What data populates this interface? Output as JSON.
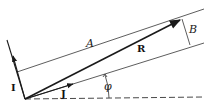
{
  "diagram": {
    "labels": {
      "A": "A",
      "B": "B",
      "R": "R",
      "I": "I",
      "J": "J",
      "phi": "φ"
    },
    "colors": {
      "ink": "#1a1a1a",
      "thin_line": "#333333"
    }
  }
}
